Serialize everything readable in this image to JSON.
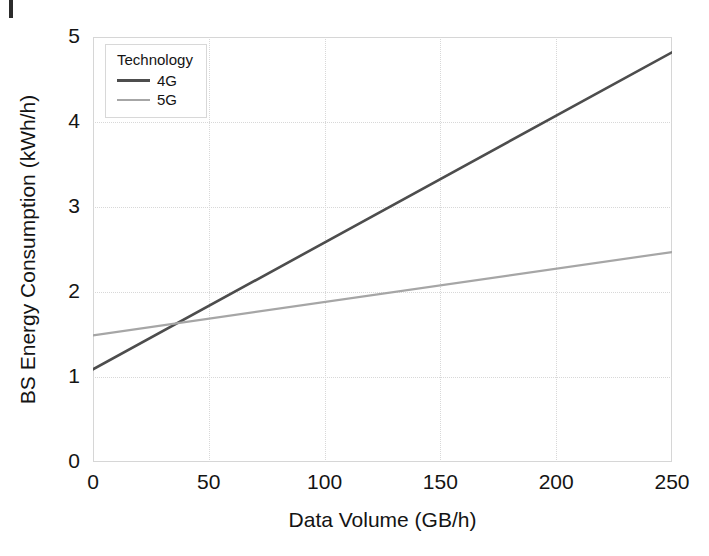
{
  "chart_data": {
    "type": "line",
    "title": "",
    "xlabel": "Data Volume (GB/h)",
    "ylabel": "BS Energy Consumption (kWh/h)",
    "xlim": [
      0,
      250
    ],
    "ylim": [
      0,
      5
    ],
    "xticks": [
      "0",
      "50",
      "100",
      "150",
      "200",
      "250"
    ],
    "xtick_values": [
      0,
      50,
      100,
      150,
      200,
      250
    ],
    "yticks": [
      "0",
      "1",
      "2",
      "3",
      "4",
      "5"
    ],
    "ytick_values": [
      0,
      1,
      2,
      3,
      4,
      5
    ],
    "grid": true,
    "grid_style": "dotted",
    "legend_title": "Technology",
    "legend_position": "upper left inside",
    "x": [
      0,
      250
    ],
    "series": [
      {
        "name": "4G",
        "color": "#4d4d4d",
        "values": [
          1.09,
          4.82
        ],
        "linewidth": 2.6
      },
      {
        "name": "5G",
        "color": "#a6a6a6",
        "values": [
          1.49,
          2.47
        ],
        "linewidth": 2.2
      }
    ],
    "annotations": [
      "4G and 5G trend lines intersect near x = 36 GB/h, y = 1.63 kWh/h"
    ]
  },
  "axes": {
    "x_ticks": [
      {
        "label": "0",
        "value": 0
      },
      {
        "label": "50",
        "value": 50
      },
      {
        "label": "100",
        "value": 100
      },
      {
        "label": "150",
        "value": 150
      },
      {
        "label": "200",
        "value": 200
      },
      {
        "label": "250",
        "value": 250
      }
    ],
    "y_ticks": [
      {
        "label": "5",
        "value": 5
      },
      {
        "label": "4",
        "value": 4
      },
      {
        "label": "3",
        "value": 3
      },
      {
        "label": "2",
        "value": 2
      },
      {
        "label": "1",
        "value": 1
      },
      {
        "label": "0",
        "value": 0
      }
    ],
    "x_title": "Data Volume (GB/h)",
    "y_title": "BS Energy Consumption (kWh/h)"
  },
  "legend": {
    "title": "Technology",
    "entries": [
      {
        "label": "4G",
        "color": "#4d4d4d"
      },
      {
        "label": "5G",
        "color": "#a6a6a6"
      }
    ]
  },
  "colors": {
    "series_4g": "#4d4d4d",
    "series_5g": "#a6a6a6",
    "grid": "#d8d8d8",
    "frame": "#d6d6d6",
    "text": "#141414",
    "background": "#ffffff"
  }
}
